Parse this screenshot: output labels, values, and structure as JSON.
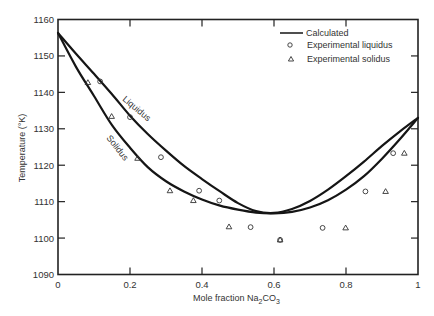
{
  "chart_data": {
    "type": "line",
    "title": "",
    "xlabel": "Mole fraction Na2CO3",
    "xlabel_parts": {
      "main": "Mole fraction Na",
      "sub1": "2",
      "mid": "CO",
      "sub2": "3"
    },
    "ylabel": "Temperature (°K)",
    "xlim": [
      0,
      1
    ],
    "ylim": [
      1090,
      1160
    ],
    "x_ticks": [
      0,
      0.2,
      0.4,
      0.6,
      0.8,
      1
    ],
    "x_tick_labels": [
      "0",
      "0.2",
      "0.4",
      "0.6",
      "0.8",
      "1"
    ],
    "y_ticks": [
      1090,
      1100,
      1110,
      1120,
      1130,
      1140,
      1150,
      1160
    ],
    "y_tick_labels": [
      "1090",
      "1100",
      "1110",
      "1120",
      "1130",
      "1140",
      "1150",
      "1160"
    ],
    "grid": false,
    "legend_position": "upper right",
    "legend": [
      {
        "label": "Calculated",
        "style": "line"
      },
      {
        "label": "Experimental liquidus",
        "style": "circle"
      },
      {
        "label": "Experimental solidus",
        "style": "triangle"
      }
    ],
    "curve_labels": {
      "liquidus": "Liquidus",
      "solidus": "Solidus"
    },
    "series": [
      {
        "name": "Calculated liquidus",
        "style": "line",
        "x": [
          0,
          0.05,
          0.1,
          0.15,
          0.2,
          0.25,
          0.3,
          0.35,
          0.4,
          0.45,
          0.5,
          0.55,
          0.6,
          0.65,
          0.7,
          0.75,
          0.8,
          0.85,
          0.9,
          0.95,
          1.0
        ],
        "y": [
          1156.3,
          1150.6,
          1145.1,
          1139.5,
          1133.6,
          1128.5,
          1124.0,
          1119.8,
          1116.2,
          1112.8,
          1109.6,
          1107.4,
          1106.9,
          1108.0,
          1110.2,
          1113.3,
          1117.0,
          1121.0,
          1125.3,
          1129.3,
          1133.0
        ]
      },
      {
        "name": "Calculated solidus",
        "style": "line",
        "x": [
          0,
          0.05,
          0.1,
          0.15,
          0.2,
          0.25,
          0.3,
          0.35,
          0.4,
          0.45,
          0.5,
          0.55,
          0.6,
          0.65,
          0.7,
          0.75,
          0.8,
          0.85,
          0.9,
          0.95,
          1.0
        ],
        "y": [
          1156.3,
          1147.0,
          1139.0,
          1131.0,
          1124.8,
          1119.4,
          1115.6,
          1112.8,
          1110.6,
          1108.9,
          1107.8,
          1107.0,
          1106.8,
          1107.2,
          1108.4,
          1110.4,
          1113.3,
          1117.0,
          1121.8,
          1127.2,
          1133.0
        ]
      },
      {
        "name": "Experimental liquidus",
        "style": "circle",
        "x": [
          0.117,
          0.2,
          0.286,
          0.392,
          0.448,
          0.535,
          0.617,
          0.735,
          0.854,
          0.931
        ],
        "y": [
          1143.0,
          1133.2,
          1122.2,
          1113.0,
          1110.3,
          1103.0,
          1099.5,
          1102.8,
          1112.8,
          1123.3
        ]
      },
      {
        "name": "Experimental solidus",
        "style": "triangle",
        "x": [
          0.083,
          0.149,
          0.221,
          0.311,
          0.376,
          0.475,
          0.617,
          0.799,
          0.91,
          0.962
        ],
        "y": [
          1142.7,
          1133.4,
          1121.9,
          1113.0,
          1110.3,
          1103.1,
          1099.5,
          1102.8,
          1112.8,
          1123.3
        ]
      }
    ]
  }
}
